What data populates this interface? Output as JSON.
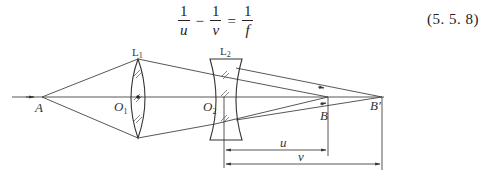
{
  "equation": {
    "term1": {
      "numerator": "1",
      "denominator": "u"
    },
    "operator1": "−",
    "term2": {
      "numerator": "1",
      "denominator": "v"
    },
    "operator2": "=",
    "term3": {
      "numerator": "1",
      "denominator": "f"
    },
    "number": "(5. 5. 8)"
  },
  "diagram": {
    "labels": {
      "point_a": "A",
      "lens1": "L",
      "lens1_sub": "1",
      "lens2": "L",
      "lens2_sub": "2",
      "center1": "O",
      "center1_sub": "1",
      "center2": "O",
      "center2_sub": "2",
      "point_b": "B",
      "point_b_prime": "B′",
      "dim_u": "u",
      "dim_v": "v"
    },
    "elements": [
      "optical axis",
      "converging lens L1 (biconvex)",
      "diverging lens L2 (biconcave)",
      "object point A",
      "intermediate image B",
      "final image B′",
      "dimension u from O2 to B",
      "dimension v from O2 to B′"
    ]
  }
}
